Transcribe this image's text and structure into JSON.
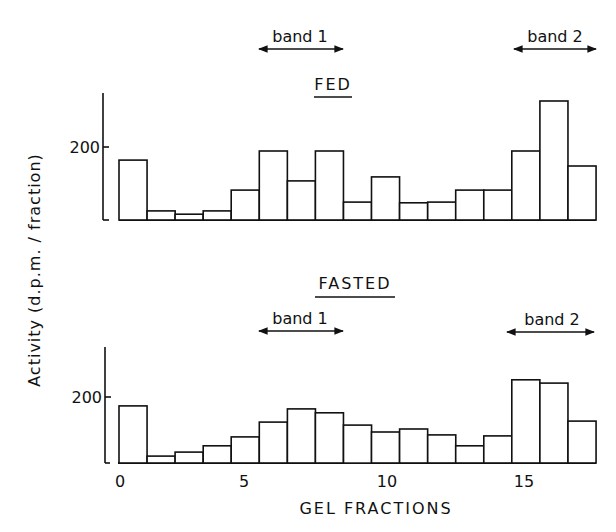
{
  "chart_data": {
    "type": "bar",
    "ylabel": "Activity (d.p.m. / fraction)",
    "xlabel": "GEL FRACTIONS",
    "x_ticks": [
      0,
      5,
      10,
      15
    ],
    "x": [
      0,
      1,
      2,
      3,
      4,
      5,
      6,
      7,
      8,
      9,
      10,
      11,
      12,
      13,
      14,
      15,
      16
    ],
    "panels": [
      {
        "title": "FED",
        "y_ticks": [
          200
        ],
        "ylim": [
          0,
          340
        ],
        "values": [
          164,
          25,
          16,
          25,
          82,
          189,
          107,
          189,
          49,
          118,
          47,
          49,
          82,
          82,
          189,
          326,
          148
        ],
        "bands": [
          {
            "label": "band 1",
            "from": 5,
            "to": 8
          },
          {
            "label": "band 2",
            "from": 14,
            "to": 17
          }
        ]
      },
      {
        "title": "FASTED",
        "y_ticks": [
          200
        ],
        "ylim": [
          0,
          350
        ],
        "values": [
          173,
          21,
          33,
          52,
          79,
          124,
          164,
          152,
          115,
          94,
          103,
          85,
          52,
          82,
          252,
          242,
          127
        ],
        "bands": [
          {
            "label": "band 1",
            "from": 5,
            "to": 8
          },
          {
            "label": "band 2",
            "from": 14,
            "to": 17
          }
        ]
      }
    ],
    "grid": false,
    "legend": "none"
  },
  "labels": {
    "ylabel": "Activity (d.p.m. / fraction)",
    "xlabel": "GEL FRACTIONS",
    "fed_title": "FED",
    "fasted_title": "FASTED",
    "band1": "band 1",
    "band2": "band 2",
    "tick200": "200",
    "xt0": "0",
    "xt5": "5",
    "xt10": "10",
    "xt15": "15"
  }
}
